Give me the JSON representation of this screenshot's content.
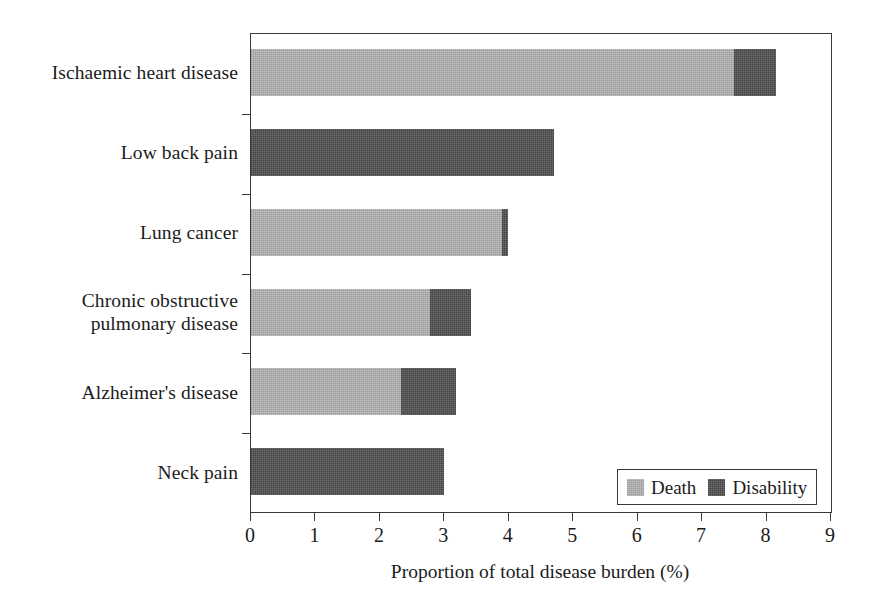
{
  "chart_data": {
    "type": "bar",
    "orientation": "horizontal",
    "stacked": true,
    "title": "",
    "xlabel": "Proportion of total disease burden (%)",
    "ylabel": "",
    "xlim": [
      0,
      9
    ],
    "xticks": [
      "0",
      "1",
      "2",
      "3",
      "4",
      "5",
      "6",
      "7",
      "8",
      "9"
    ],
    "grid": false,
    "legend_position": "bottom-right",
    "categories": [
      "Ischaemic heart disease",
      "Low back pain",
      "Lung cancer",
      "Chronic obstructive pulmonary disease",
      "Alzheimer's disease",
      "Neck pain"
    ],
    "category_label_lines": [
      [
        "Ischaemic heart disease"
      ],
      [
        "Low back pain"
      ],
      [
        "Lung cancer"
      ],
      [
        "Chronic obstructive",
        "pulmonary disease"
      ],
      [
        "Alzheimer's disease"
      ],
      [
        "Neck pain"
      ]
    ],
    "series": [
      {
        "name": "Death",
        "color": "#a5a5a5",
        "values": [
          7.5,
          0.0,
          3.9,
          2.77,
          2.33,
          0.0
        ]
      },
      {
        "name": "Disability",
        "color": "#4c4c4c",
        "values": [
          0.65,
          4.7,
          0.09,
          0.65,
          0.85,
          3.0
        ]
      }
    ],
    "totals": [
      8.15,
      4.7,
      3.99,
      3.42,
      3.18,
      3.0
    ]
  },
  "legend": {
    "entries": [
      {
        "label": "Death",
        "color": "#a5a5a5"
      },
      {
        "label": "Disability",
        "color": "#4c4c4c"
      }
    ]
  },
  "axis": {
    "x_title": "Proportion of total disease burden (%)"
  }
}
